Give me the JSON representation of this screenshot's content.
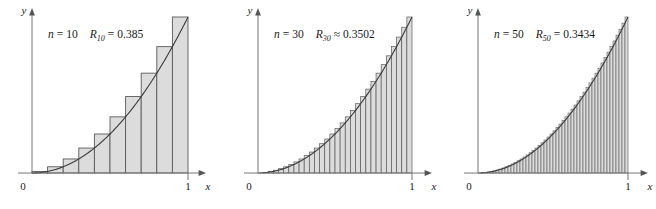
{
  "figure": {
    "kind": "riemann-sum-panels",
    "background_color": "#ffffff",
    "panel_count": 3
  },
  "style": {
    "bar_fill": "#dcdcdc",
    "bar_stroke": "#5a5a5a",
    "curve_color": "#3a3a3a",
    "axis_color": "#555555",
    "text_color": "#1a1a1a"
  },
  "panels": [
    {
      "id": "panel-n10",
      "n_symbol": "n",
      "n_equals": "=",
      "n_value": "10",
      "r_symbol": "R",
      "r_subscript": "10",
      "relation": "=",
      "r_value": "0.385",
      "label_text": "n = 10    R10 = 0.385",
      "x_axis_label": "x",
      "y_axis_label": "y",
      "x_tick_origin": "0",
      "x_tick_right": "1"
    },
    {
      "id": "panel-n30",
      "n_symbol": "n",
      "n_equals": "=",
      "n_value": "30",
      "r_symbol": "R",
      "r_subscript": "30",
      "relation": "≈",
      "r_value": "0.3502",
      "label_text": "n = 30    R30 ≈ 0.3502",
      "x_axis_label": "x",
      "y_axis_label": "y",
      "x_tick_origin": "0",
      "x_tick_right": "1"
    },
    {
      "id": "panel-n50",
      "n_symbol": "n",
      "n_equals": "=",
      "n_value": "50",
      "r_symbol": "R",
      "r_subscript": "50",
      "relation": "=",
      "r_value": "0.3434",
      "label_text": "n = 50    R50 = 0.3434",
      "x_axis_label": "x",
      "y_axis_label": "y",
      "x_tick_origin": "0",
      "x_tick_right": "1"
    }
  ],
  "chart_data": [
    {
      "type": "bar",
      "title": "n = 10    R10 = 0.385",
      "xlabel": "x",
      "ylabel": "y",
      "xlim": [
        0,
        1
      ],
      "ylim": [
        0,
        1
      ],
      "grid": false,
      "legend": "none",
      "function": "y = x^2",
      "method": "right-endpoint Riemann sum",
      "n": 10,
      "sum_value": 0.385,
      "sum_relation": "=",
      "xticks": [
        0,
        1
      ],
      "xticklabels": [
        "0",
        "1"
      ],
      "categories": [
        "0.1",
        "0.2",
        "0.3",
        "0.4",
        "0.5",
        "0.6",
        "0.7",
        "0.8",
        "0.9",
        "1.0"
      ],
      "bar_left_edges": [
        0.0,
        0.1,
        0.2,
        0.3,
        0.4,
        0.5,
        0.6,
        0.7,
        0.8,
        0.9
      ],
      "bar_width": 0.1,
      "values": [
        0.01,
        0.04,
        0.09,
        0.16,
        0.25,
        0.36,
        0.49,
        0.64,
        0.81,
        1.0
      ],
      "curve": {
        "name": "y = x^2",
        "x": [
          0,
          0.1,
          0.2,
          0.3,
          0.4,
          0.5,
          0.6,
          0.7,
          0.8,
          0.9,
          1.0
        ],
        "y": [
          0,
          0.01,
          0.04,
          0.09,
          0.16,
          0.25,
          0.36,
          0.49,
          0.64,
          0.81,
          1.0
        ]
      }
    },
    {
      "type": "bar",
      "title": "n = 30    R30 ≈ 0.3502",
      "xlabel": "x",
      "ylabel": "y",
      "xlim": [
        0,
        1
      ],
      "ylim": [
        0,
        1
      ],
      "grid": false,
      "legend": "none",
      "function": "y = x^2",
      "method": "right-endpoint Riemann sum",
      "n": 30,
      "sum_value": 0.3502,
      "sum_relation": "≈",
      "xticks": [
        0,
        1
      ],
      "xticklabels": [
        "0",
        "1"
      ],
      "bar_width": 0.03333,
      "curve": {
        "name": "y = x^2"
      }
    },
    {
      "type": "bar",
      "title": "n = 50    R50 = 0.3434",
      "xlabel": "x",
      "ylabel": "y",
      "xlim": [
        0,
        1
      ],
      "ylim": [
        0,
        1
      ],
      "grid": false,
      "legend": "none",
      "function": "y = x^2",
      "method": "right-endpoint Riemann sum",
      "n": 50,
      "sum_value": 0.3434,
      "sum_relation": "=",
      "xticks": [
        0,
        1
      ],
      "xticklabels": [
        "0",
        "1"
      ],
      "bar_width": 0.02,
      "curve": {
        "name": "y = x^2"
      }
    }
  ]
}
